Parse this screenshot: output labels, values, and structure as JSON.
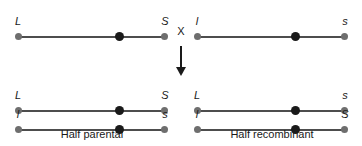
{
  "figure": {
    "cross_symbol": "X",
    "arrow_icon": "down-arrow-icon"
  },
  "parents": [
    {
      "id": "parent-left",
      "left_allele": "L",
      "right_allele": "S",
      "x": 18,
      "width": 147,
      "y": 30,
      "centromere_pct": 69
    },
    {
      "id": "parent-right",
      "left_allele": "l",
      "right_allele": "s",
      "x": 197,
      "width": 148,
      "y": 30,
      "centromere_pct": 66
    }
  ],
  "offspring": [
    {
      "id": "half-parental",
      "caption": "Half parental",
      "caption_x": 92,
      "caption_y": 128,
      "chromosomes": [
        {
          "id": "parental-chromosome-1",
          "left_allele": "L",
          "right_allele": "S",
          "x": 18,
          "width": 147,
          "y": 104,
          "centromere_pct": 69
        },
        {
          "id": "parental-chromosome-2",
          "left_allele": "l",
          "right_allele": "s",
          "x": 18,
          "width": 147,
          "y": 123,
          "centromere_pct": 69
        }
      ]
    },
    {
      "id": "half-recombinant",
      "caption": "Half recombinant",
      "caption_x": 272,
      "caption_y": 128,
      "chromosomes": [
        {
          "id": "recombinant-chromosome-1",
          "left_allele": "L",
          "right_allele": "s",
          "x": 197,
          "width": 148,
          "y": 104,
          "centromere_pct": 66
        },
        {
          "id": "recombinant-chromosome-2",
          "left_allele": "l",
          "right_allele": "S",
          "x": 197,
          "width": 148,
          "y": 123,
          "centromere_pct": 66
        }
      ]
    }
  ],
  "colors": {
    "line": "#4d4d4d",
    "tip": "#6e6e6e",
    "centromere": "#1a1a1a",
    "text": "#1a1a1a",
    "background": "#ffffff"
  }
}
